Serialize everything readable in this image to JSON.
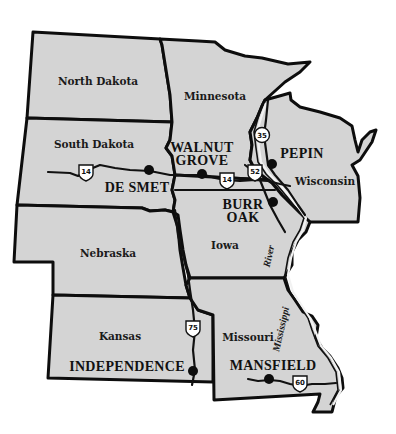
{
  "map": {
    "fill_color": "#d4d4d4",
    "border_color": "#0d0d0d",
    "background_color": "#ffffff",
    "states": [
      {
        "id": "north-dakota",
        "label": "North Dakota"
      },
      {
        "id": "south-dakota",
        "label": "South Dakota"
      },
      {
        "id": "nebraska",
        "label": "Nebraska"
      },
      {
        "id": "kansas",
        "label": "Kansas"
      },
      {
        "id": "minnesota",
        "label": "Minnesota"
      },
      {
        "id": "wisconsin",
        "label": "Wisconsin"
      },
      {
        "id": "iowa",
        "label": "Iowa"
      },
      {
        "id": "missouri",
        "label": "Missouri"
      }
    ],
    "towns": [
      {
        "id": "de-smet",
        "label": "DE SMET"
      },
      {
        "id": "walnut-grove",
        "label_line1": "WALNUT",
        "label_line2": "GROVE"
      },
      {
        "id": "pepin",
        "label": "PEPIN"
      },
      {
        "id": "burr-oak",
        "label_line1": "BURR",
        "label_line2": "OAK"
      },
      {
        "id": "independence",
        "label": "INDEPENDENCE"
      },
      {
        "id": "mansfield",
        "label": "MANSFIELD"
      }
    ],
    "highways": [
      {
        "id": "us-14",
        "number": "14"
      },
      {
        "id": "us-14-east",
        "number": "14"
      },
      {
        "id": "us-35",
        "number": "35"
      },
      {
        "id": "us-52",
        "number": "52"
      },
      {
        "id": "us-75",
        "number": "75"
      },
      {
        "id": "us-60",
        "number": "60"
      }
    ],
    "river": {
      "label_line1": "Mississippi",
      "label_line2": "River"
    }
  }
}
